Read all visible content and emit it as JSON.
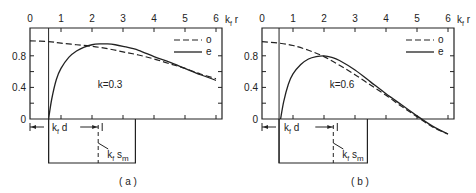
{
  "chart_data": [
    {
      "type": "line",
      "panel_label": "( a )",
      "annotation": "k=0.3",
      "xlabel": "k_f r",
      "ylabel": "",
      "xlim": [
        0,
        6.2
      ],
      "ylim": [
        0,
        1.05
      ],
      "x_ticks": [
        "0",
        "1",
        "2",
        "3",
        "4",
        "5",
        "6"
      ],
      "y_ticks": [
        {
          "label": "0.8",
          "value": 0.8
        },
        {
          "label": "0.4",
          "value": 0.4
        },
        {
          "label": "0",
          "value": 0
        }
      ],
      "legend": [
        {
          "name": "o",
          "style": "dashed"
        },
        {
          "name": "e",
          "style": "solid"
        }
      ],
      "legend_position": "top-right",
      "vertical_line_x": 0.6,
      "dimension_labels": {
        "d": "k_f d",
        "s": "k_f s_m"
      },
      "box": {
        "x_start": 0.6,
        "x_end": 3.4,
        "dashed_x": 2.2
      },
      "series": [
        {
          "name": "o",
          "style": "dashed",
          "x": [
            0,
            0.6,
            1,
            1.5,
            2,
            2.5,
            3,
            3.5,
            4,
            4.5,
            5,
            5.5,
            6
          ],
          "y": [
            0.99,
            0.98,
            0.96,
            0.94,
            0.92,
            0.89,
            0.85,
            0.81,
            0.76,
            0.7,
            0.64,
            0.57,
            0.51
          ]
        },
        {
          "name": "e",
          "style": "solid",
          "x": [
            0.6,
            0.7,
            0.85,
            1,
            1.25,
            1.5,
            1.75,
            2,
            2.25,
            2.5,
            2.75,
            3,
            3.5,
            4,
            4.5,
            5,
            5.5,
            6
          ],
          "y": [
            0,
            0.25,
            0.5,
            0.64,
            0.78,
            0.86,
            0.91,
            0.94,
            0.95,
            0.95,
            0.94,
            0.92,
            0.87,
            0.79,
            0.72,
            0.64,
            0.56,
            0.49
          ]
        }
      ]
    },
    {
      "type": "line",
      "panel_label": "( b )",
      "annotation": "k=0.6",
      "xlabel": "k_f r",
      "ylabel": "",
      "xlim": [
        0,
        6.2
      ],
      "ylim": [
        0,
        1.05
      ],
      "x_ticks": [
        "0",
        "1",
        "2",
        "3",
        "4",
        "5",
        "6"
      ],
      "y_ticks": [
        {
          "label": "0.8",
          "value": 0.8
        },
        {
          "label": "0.4",
          "value": 0.4
        },
        {
          "label": "0",
          "value": 0
        }
      ],
      "legend": [
        {
          "name": "o",
          "style": "dashed"
        },
        {
          "name": "e",
          "style": "solid"
        }
      ],
      "legend_position": "top-right",
      "vertical_line_x": 0.55,
      "dimension_labels": {
        "d": "k_f d",
        "s": "k_f s_m"
      },
      "box": {
        "x_start": 0.55,
        "x_end": 3.4,
        "dashed_x": 2.3
      },
      "series": [
        {
          "name": "o",
          "style": "dashed",
          "x": [
            0,
            0.55,
            1,
            1.5,
            2,
            2.5,
            3,
            3.5,
            4,
            4.5,
            5,
            5.5,
            6
          ],
          "y": [
            0.98,
            0.96,
            0.93,
            0.87,
            0.79,
            0.68,
            0.56,
            0.43,
            0.3,
            0.16,
            0.03,
            -0.1,
            -0.19
          ]
        },
        {
          "name": "e",
          "style": "solid",
          "x": [
            0.6,
            0.7,
            0.85,
            1,
            1.25,
            1.5,
            1.75,
            2,
            2.25,
            2.5,
            3,
            3.5,
            4,
            4.5,
            5,
            5.5,
            6
          ],
          "y": [
            0,
            0.22,
            0.44,
            0.57,
            0.69,
            0.76,
            0.79,
            0.8,
            0.78,
            0.74,
            0.62,
            0.47,
            0.32,
            0.18,
            0.04,
            -0.09,
            -0.19
          ]
        }
      ]
    }
  ]
}
